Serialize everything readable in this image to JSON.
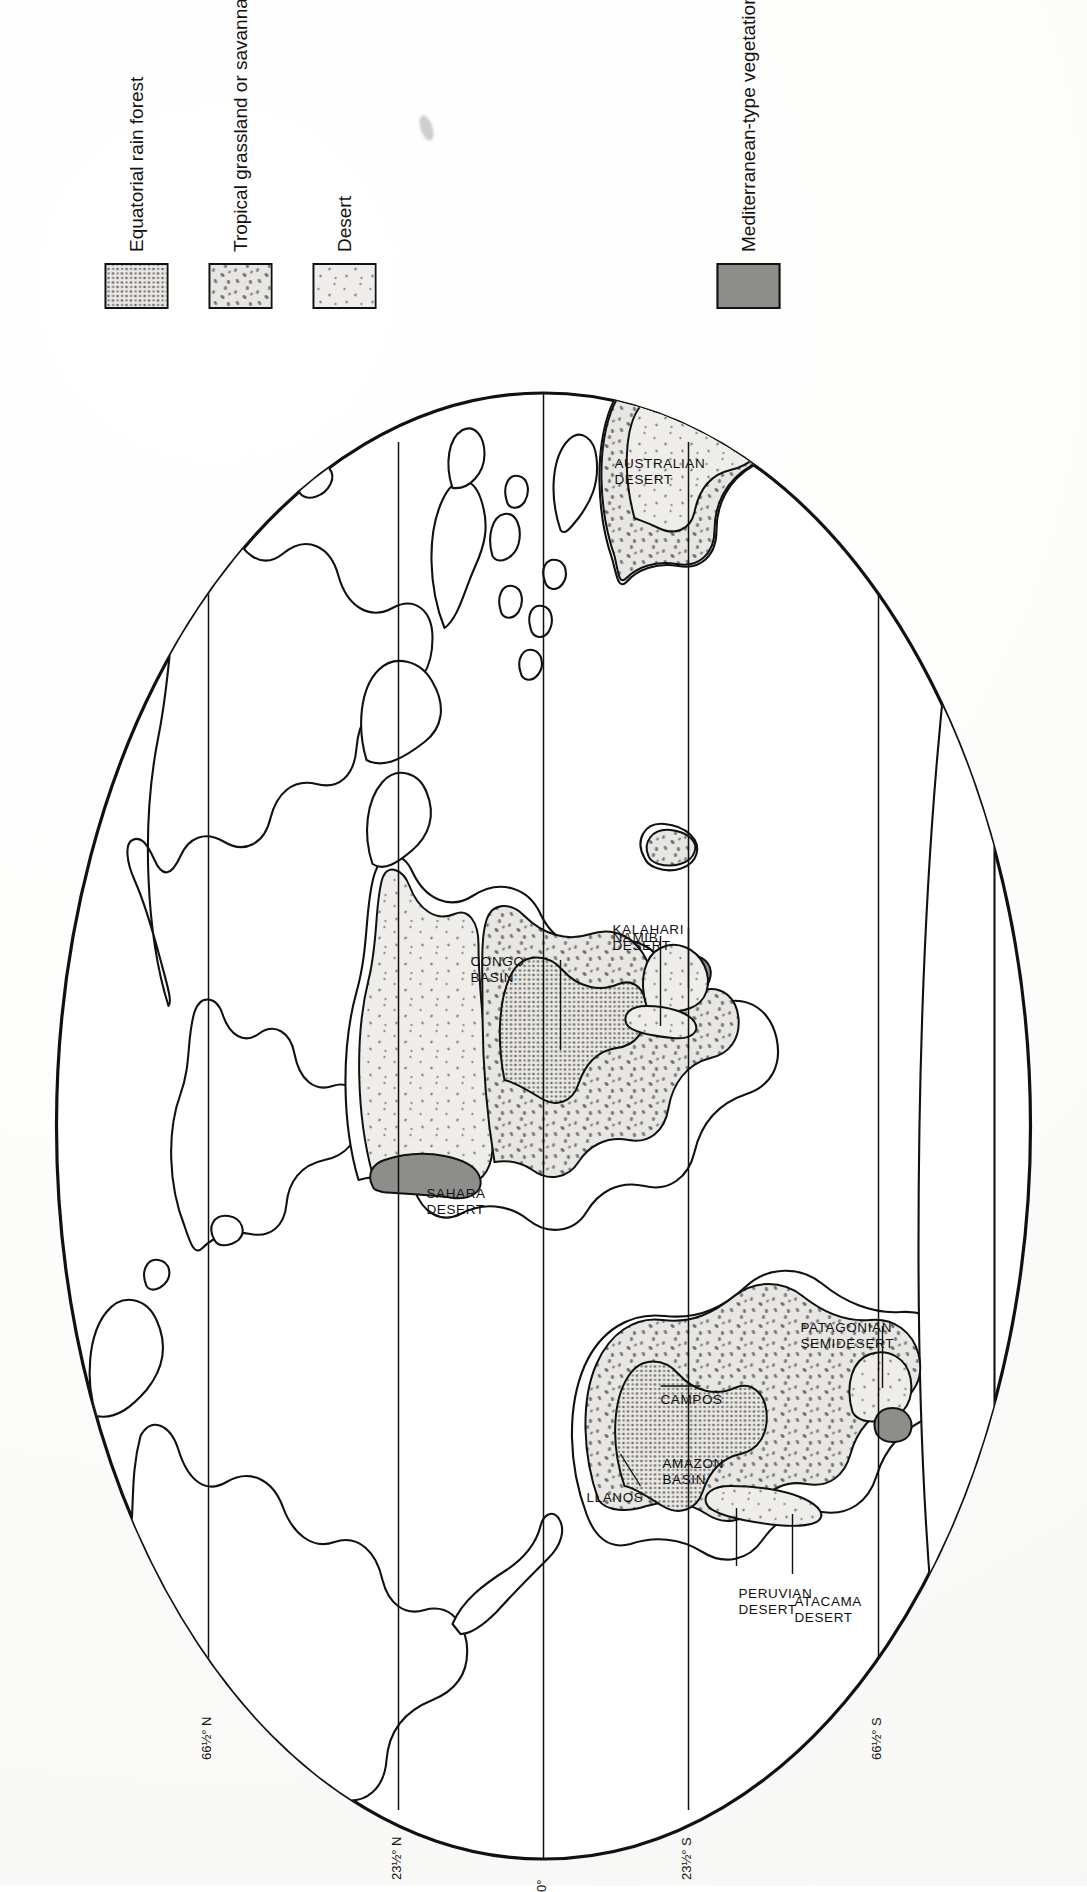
{
  "figure": {
    "type": "thematic world map",
    "title": "",
    "projection": "elliptical (Mollweide-style) world projection",
    "orientation_note": "map and all labels rendered rotated 90 degrees counter-clockwise on the page"
  },
  "map": {
    "latitude_lines": [
      {
        "id": "lat-66n",
        "label": "66½° N"
      },
      {
        "id": "lat-23n",
        "label": "23½° N"
      },
      {
        "id": "lat-eq",
        "label": "0°"
      },
      {
        "id": "lat-23s",
        "label": "23½° S"
      },
      {
        "id": "lat-66s",
        "label": "66½° S"
      }
    ],
    "region_labels": [
      {
        "id": "sahara",
        "lines": [
          "SAHARA",
          "DESERT"
        ]
      },
      {
        "id": "congo",
        "lines": [
          "CONGO",
          "BASIN"
        ]
      },
      {
        "id": "namib",
        "lines": [
          "NAMIB"
        ]
      },
      {
        "id": "kalahari",
        "lines": [
          "KALAHARI",
          "DESERT"
        ]
      },
      {
        "id": "australian",
        "lines": [
          "AUSTRALIAN",
          "DESERT"
        ]
      },
      {
        "id": "llanos",
        "lines": [
          "LLANOS"
        ]
      },
      {
        "id": "amazon",
        "lines": [
          "AMAZON",
          "BASIN"
        ]
      },
      {
        "id": "campos",
        "lines": [
          "CAMPOS"
        ]
      },
      {
        "id": "peruvian",
        "lines": [
          "PERUVIAN",
          "DESERT"
        ]
      },
      {
        "id": "atacama",
        "lines": [
          "ATACAMA",
          "DESERT"
        ]
      },
      {
        "id": "patagonian",
        "lines": [
          "PATAGONIAN",
          "SEMIDESERT"
        ]
      }
    ]
  },
  "legend": {
    "items": [
      {
        "id": "equatorial-rain-forest",
        "label": "Equatorial rain forest",
        "pattern": "fine dense stipple",
        "fill": "#e6e5e2"
      },
      {
        "id": "tropical-grassland",
        "label": "Tropical grassland or savanna",
        "pattern": "coarse stipple",
        "fill": "#e6e5e2"
      },
      {
        "id": "desert",
        "label": "Desert",
        "pattern": "sparse stipple",
        "fill": "#ececeb"
      },
      {
        "id": "mediterranean-vegetation",
        "label": "Mediterranean-type vegetation",
        "pattern": "solid dark grey",
        "fill": "#8d8d8a"
      }
    ]
  },
  "colors": {
    "ink": "#111111",
    "paper": "#ffffff",
    "stipple_fill": "#e6e5e2",
    "desert_fill": "#ececea",
    "mediterranean": "#8d8d8a"
  }
}
